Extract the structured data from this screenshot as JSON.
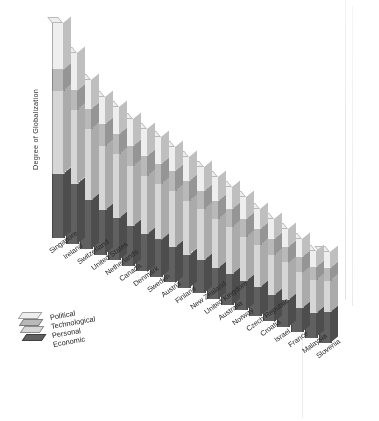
{
  "chart_data": {
    "type": "bar",
    "subtype": "stacked-3d-column",
    "title": "",
    "xlabel": "",
    "ylabel": "Degree of Globalization",
    "grid": false,
    "legend_position": "bottom-left",
    "axis_tick_labels": [],
    "ylim": [
      0,
      100
    ],
    "categories": [
      "Singapore",
      "Ireland",
      "Switzerland",
      "United States",
      "Netherlands",
      "Canada",
      "Denmark",
      "Sweden",
      "Austria",
      "Finland",
      "New Zealand",
      "United Kingdom",
      "Australia",
      "Norway",
      "Czech Republic",
      "Croatia",
      "Israel",
      "France",
      "Malaysia",
      "Slovenia"
    ],
    "series": [
      {
        "name": "Political",
        "color": "#efefef",
        "values": [
          21,
          17,
          13,
          12,
          12,
          12,
          12,
          12,
          11,
          11,
          11,
          11,
          10,
          10,
          9,
          9,
          8,
          8,
          7,
          7
        ]
      },
      {
        "name": "Technological",
        "color": "#b9b9b9",
        "values": [
          10,
          9,
          9,
          10,
          9,
          9,
          9,
          9,
          9,
          9,
          8,
          8,
          8,
          8,
          7,
          7,
          7,
          7,
          6,
          6
        ]
      },
      {
        "name": "Personal",
        "color": "#d6d6d6",
        "values": [
          37,
          33,
          32,
          29,
          29,
          27,
          26,
          25,
          25,
          24,
          23,
          22,
          21,
          20,
          19,
          18,
          17,
          16,
          15,
          14
        ]
      },
      {
        "name": "Economic",
        "color": "#5e5e5e",
        "values": [
          29,
          27,
          22,
          20,
          19,
          18,
          17,
          17,
          16,
          15,
          15,
          14,
          14,
          13,
          13,
          12,
          12,
          11,
          11,
          14
        ]
      }
    ],
    "totals": [
      97,
      86,
      76,
      71,
      69,
      66,
      64,
      63,
      61,
      59,
      57,
      55,
      53,
      51,
      48,
      46,
      44,
      42,
      39,
      41
    ]
  },
  "legend": {
    "items": [
      {
        "label": "Political"
      },
      {
        "label": "Technological"
      },
      {
        "label": "Personal"
      },
      {
        "label": "Economic"
      }
    ]
  },
  "colors": {
    "political": "#efefef",
    "technological": "#b9b9b9",
    "personal": "#d6d6d6",
    "economic": "#5e5e5e",
    "background": "#ffffff",
    "text": "#252525"
  }
}
